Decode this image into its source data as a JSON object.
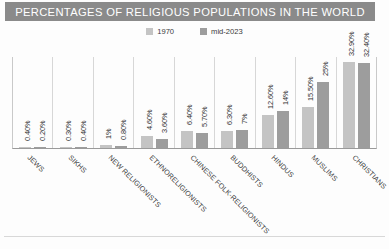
{
  "header": {
    "title": "PERCENTAGES OF RELIGIOUS POPULATIONS IN THE WORLD",
    "band_color": "#8a8a8a",
    "title_color": "#ffffff"
  },
  "legend": {
    "position": "top-center",
    "items": [
      {
        "label": "1970",
        "color": "#c4c4c4"
      },
      {
        "label": "mid-2023",
        "color": "#9d9d9d"
      }
    ]
  },
  "chart_data": {
    "type": "bar",
    "title": "PERCENTAGES OF RELIGIOUS POPULATIONS IN THE WORLD",
    "xlabel": "",
    "ylabel": "",
    "ylim": [
      0,
      35
    ],
    "grid": false,
    "legend_position": "top-center",
    "categories": [
      "JEWS",
      "SIKHS",
      "NEW RELIGIONISTS",
      "ETHNORELIGIONISTS",
      "CHINESE FOLK-RELIGIONISTS",
      "BUDDHISTS",
      "HINDUS",
      "MUSLIMS",
      "CHRISTIANS"
    ],
    "series": [
      {
        "name": "1970",
        "color": "#c4c4c4",
        "values": [
          0.4,
          0.3,
          1,
          4.6,
          6.4,
          6.3,
          12.6,
          15.5,
          32.9
        ],
        "labels": [
          "0.40%",
          "0.30%",
          "1%",
          "4.60%",
          "6.40%",
          "6.30%",
          "12.60%",
          "15.50%",
          "32.90%"
        ]
      },
      {
        "name": "mid-2023",
        "color": "#9d9d9d",
        "values": [
          0.2,
          0.4,
          0.8,
          3.6,
          5.7,
          7,
          14,
          25,
          32.4
        ],
        "labels": [
          "0.20%",
          "0.40%",
          "0.80%",
          "3.60%",
          "5.70%",
          "7%",
          "14%",
          "25%",
          "32.40%"
        ]
      }
    ]
  }
}
